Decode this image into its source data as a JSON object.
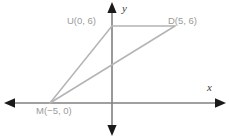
{
  "figure": {
    "type": "coordinate-geometry-diagram",
    "axes": {
      "x_label": "x",
      "y_label": "y",
      "x_axis_color": "#808080",
      "y_axis_color": "#808080",
      "arrows": [
        "left",
        "right",
        "up",
        "down"
      ]
    },
    "shape": {
      "name": "MUD",
      "stroke_color": "#b4b4b4",
      "vertices": [
        {
          "name": "M",
          "label": "M(−5, 0)",
          "x": -5,
          "y": 0,
          "px": 50,
          "py": 103
        },
        {
          "name": "U",
          "label": "U(0, 6)",
          "x": 0,
          "y": 6,
          "px": 112,
          "py": 26
        },
        {
          "name": "D",
          "label": "D(5, 6)",
          "x": 5,
          "y": 6,
          "px": 175,
          "py": 26
        }
      ],
      "edges": [
        {
          "from": "M",
          "to": "U"
        },
        {
          "from": "U",
          "to": "D"
        },
        {
          "from": "D",
          "to": "M"
        }
      ]
    },
    "label_color": "#9a9a9a"
  }
}
